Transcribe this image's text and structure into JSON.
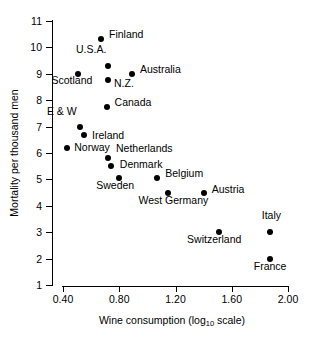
{
  "chart_data": {
    "type": "scatter",
    "title": "",
    "xlabel": "Wine consumption (log10 scale)",
    "xlabel_parts": {
      "pre": "Wine consumption (log",
      "sub": "10",
      "post": " scale)"
    },
    "ylabel": "Mortality per thousand men",
    "xlim": [
      0.31,
      2.02
    ],
    "ylim": [
      1,
      11
    ],
    "xticks": [
      "0.40",
      "0.80",
      "1.20",
      "1.60",
      "2.00"
    ],
    "xtick_values": [
      0.4,
      0.8,
      1.2,
      1.6,
      2.0
    ],
    "yticks": [
      "11",
      "10",
      "9",
      "8",
      "7",
      "6",
      "5",
      "4",
      "3",
      "2",
      "1"
    ],
    "ytick_values": [
      11,
      10,
      9,
      8,
      7,
      6,
      5,
      4,
      3,
      2,
      1
    ],
    "grid": false,
    "legend": null,
    "marker_color": "#000000",
    "axis_color": "#000000",
    "background_color": "#ffffff",
    "points": [
      {
        "name": "Finland",
        "x": 0.67,
        "y": 10.3,
        "label_dx": 8,
        "label_dy": -5
      },
      {
        "name": "U.S.A.",
        "x": 0.72,
        "y": 9.3,
        "label_dx": -32,
        "label_dy": -17
      },
      {
        "name": "Australia",
        "x": 0.89,
        "y": 9.0,
        "label_dx": 8,
        "label_dy": -5
      },
      {
        "name": "Scotland",
        "x": 0.51,
        "y": 9.0,
        "label_dx": -27,
        "label_dy": 6
      },
      {
        "name": "N.Z.",
        "x": 0.72,
        "y": 8.75,
        "label_dx": 6,
        "label_dy": 3
      },
      {
        "name": "Canada",
        "x": 0.71,
        "y": 7.75,
        "label_dx": 8,
        "label_dy": -5
      },
      {
        "name": "E & W",
        "x": 0.52,
        "y": 7.0,
        "label_dx": -33,
        "label_dy": -16
      },
      {
        "name": "Ireland",
        "x": 0.55,
        "y": 6.7,
        "label_dx": 8,
        "label_dy": 0
      },
      {
        "name": "Norway",
        "x": 0.43,
        "y": 6.2,
        "label_dx": 7,
        "label_dy": -1
      },
      {
        "name": "Netherlands",
        "x": 0.72,
        "y": 5.8,
        "label_dx": 8,
        "label_dy": -10
      },
      {
        "name": "Denmark",
        "x": 0.74,
        "y": 5.5,
        "label_dx": 9,
        "label_dy": -2
      },
      {
        "name": "Sweden",
        "x": 0.8,
        "y": 5.05,
        "label_dx": -23,
        "label_dy": 7
      },
      {
        "name": "Belgium",
        "x": 1.07,
        "y": 5.05,
        "label_dx": 8,
        "label_dy": -5
      },
      {
        "name": "Austria",
        "x": 1.4,
        "y": 4.5,
        "label_dx": 8,
        "label_dy": -4
      },
      {
        "name": "West Germany",
        "x": 1.15,
        "y": 4.5,
        "label_dx": -30,
        "label_dy": 7
      },
      {
        "name": "Italy",
        "x": 1.87,
        "y": 3.0,
        "label_dx": -8,
        "label_dy": -17
      },
      {
        "name": "Switzerland",
        "x": 1.51,
        "y": 3.0,
        "label_dx": -32,
        "label_dy": 7
      },
      {
        "name": "France",
        "x": 1.87,
        "y": 2.0,
        "label_dx": -16,
        "label_dy": 7
      }
    ]
  }
}
